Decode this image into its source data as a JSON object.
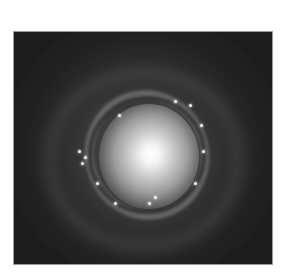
{
  "image": {
    "subject": "spiral galaxy",
    "description": "Grayscale astronomical photograph of a face-on spiral galaxy with a bright central bulge, a ring of bright star-forming knots, and faint outer spiral arms on a dark background",
    "colors": {
      "page_background": "#ffffff",
      "sky_background": "#1c1c1c",
      "border": "#9a9a9a",
      "core": "#ffffff"
    }
  }
}
